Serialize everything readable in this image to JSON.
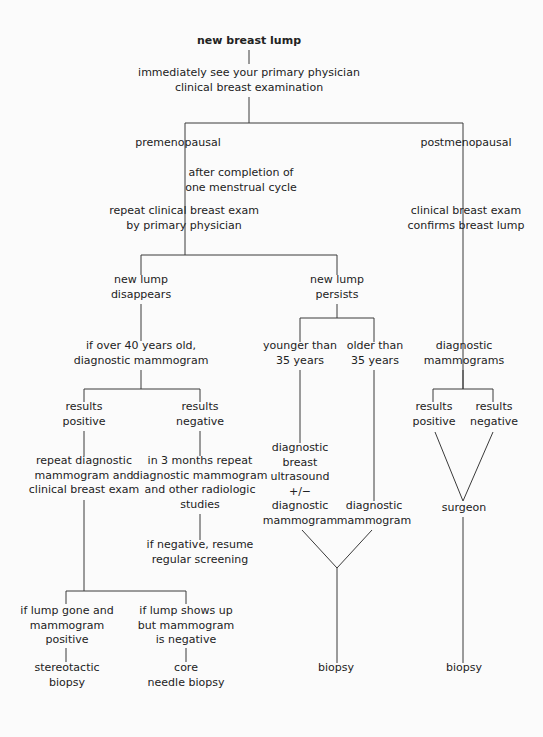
{
  "title": "new breast lump",
  "nodes": {
    "root": [
      "new breast lump"
    ],
    "see_physician": [
      "immediately see your primary physician",
      "clinical breast examination"
    ],
    "premenopausal": [
      "premenopausal"
    ],
    "after_cycle": [
      "after completion of",
      "one menstrual cycle"
    ],
    "repeat_exam": [
      "repeat clinical breast exam",
      "by primary physician"
    ],
    "postmenopausal": [
      "postmenopausal"
    ],
    "confirms_lump": [
      "clinical breast exam",
      "confirms breast lump"
    ],
    "lump_disappears": [
      "new lump",
      "disappears"
    ],
    "lump_persists": [
      "new lump",
      "persists"
    ],
    "over_40": [
      "if over 40 years old,",
      "diagnostic mammogram"
    ],
    "younger_35": [
      "younger than",
      "35 years"
    ],
    "older_35": [
      "older than",
      "35 years"
    ],
    "diag_mammograms": [
      "diagnostic",
      "mammograms"
    ],
    "left_results_positive": [
      "results",
      "positive"
    ],
    "left_results_negative": [
      "results",
      "negative"
    ],
    "repeat_diag": [
      "repeat diagnostic",
      "mammogram and",
      "clinical breast exam"
    ],
    "three_months": [
      "in 3 months repeat",
      "diagnostic mammogram",
      "and other radiologic",
      "studies"
    ],
    "resume_screening": [
      "if negative, resume",
      "regular screening"
    ],
    "ultrasound": [
      "diagnostic",
      "breast",
      "ultrasound",
      "+/−",
      "diagnostic",
      "mammogram"
    ],
    "older_diag": [
      "diagnostic",
      "mammogram"
    ],
    "right_results_positive": [
      "results",
      "positive"
    ],
    "right_results_negative": [
      "results",
      "negative"
    ],
    "surgeon": [
      "surgeon"
    ],
    "lump_gone": [
      "if lump gone and",
      "mammogram",
      "positive"
    ],
    "lump_shows": [
      "if lump shows up",
      "but mammogram",
      "is negative"
    ],
    "stereotactic": [
      "stereotactic",
      "biopsy"
    ],
    "core_needle": [
      "core",
      "needle biopsy"
    ],
    "biopsy_middle": [
      "biopsy"
    ],
    "biopsy_right": [
      "biopsy"
    ]
  },
  "colors": {
    "line": "#3a3a3a",
    "text": "#222222",
    "background": "#fbfbfb"
  }
}
